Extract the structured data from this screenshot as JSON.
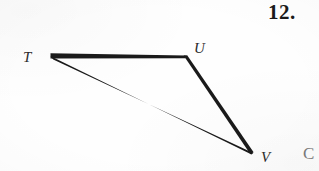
{
  "page": {
    "background_color": "#fefefe",
    "ink_color": "#1a1a1a",
    "width": 319,
    "height": 171
  },
  "problem": {
    "number_label": "12."
  },
  "figure": {
    "name": "triangle-TUV",
    "shape_type": "triangle",
    "stroke_color": "#1a1a1a",
    "vertices": [
      {
        "id": "T",
        "label": "T",
        "x": 51,
        "y": 56
      },
      {
        "id": "U",
        "label": "U",
        "x": 185,
        "y": 57
      },
      {
        "id": "V",
        "label": "V",
        "x": 252,
        "y": 153
      }
    ],
    "edges": [
      {
        "id": "TU",
        "from": "T",
        "to": "U"
      },
      {
        "id": "UV",
        "from": "U",
        "to": "V"
      },
      {
        "id": "TV",
        "from": "T",
        "to": "V"
      }
    ],
    "label_positions": {
      "T": {
        "x": 30,
        "y": 58
      },
      "U": {
        "x": 200,
        "y": 49
      },
      "V": {
        "x": 268,
        "y": 158
      }
    }
  },
  "margin_fragment": {
    "text": "C"
  }
}
